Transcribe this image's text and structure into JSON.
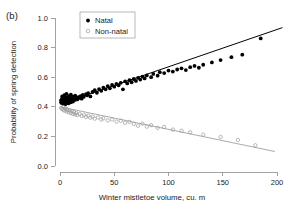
{
  "panel": {
    "label": "(b)"
  },
  "chart_data": {
    "type": "scatter",
    "title": "",
    "xlabel": "Winter mistletoe volume, cu. m",
    "ylabel": "Probability of spring detection",
    "xlim": [
      -8,
      210
    ],
    "ylim": [
      0.0,
      1.0
    ],
    "xticks": [
      0,
      50,
      100,
      150,
      200
    ],
    "xtick_labels": [
      "0",
      "50",
      "100",
      "150",
      "200"
    ],
    "yticks": [
      0.0,
      0.2,
      0.4,
      0.6,
      0.8,
      1.0
    ],
    "ytick_labels": [
      "0.0",
      "0.2",
      "0.4",
      "0.6",
      "0.8",
      "1.0"
    ],
    "grid": false,
    "legend_position": "top-left-inside",
    "series": [
      {
        "name": "Natal",
        "marker": "filled-circle",
        "color": "#000000",
        "points": [
          [
            1,
            0.43
          ],
          [
            1,
            0.445
          ],
          [
            2,
            0.425
          ],
          [
            2,
            0.455
          ],
          [
            2,
            0.47
          ],
          [
            3,
            0.42
          ],
          [
            3,
            0.44
          ],
          [
            3,
            0.462
          ],
          [
            4,
            0.432
          ],
          [
            4,
            0.45
          ],
          [
            4,
            0.478
          ],
          [
            5,
            0.418
          ],
          [
            5,
            0.442
          ],
          [
            5,
            0.465
          ],
          [
            6,
            0.428
          ],
          [
            6,
            0.452
          ],
          [
            6,
            0.488
          ],
          [
            7,
            0.436
          ],
          [
            7,
            0.458
          ],
          [
            8,
            0.424
          ],
          [
            8,
            0.447
          ],
          [
            8,
            0.472
          ],
          [
            9,
            0.44
          ],
          [
            9,
            0.463
          ],
          [
            10,
            0.43
          ],
          [
            10,
            0.455
          ],
          [
            10,
            0.482
          ],
          [
            11,
            0.444
          ],
          [
            12,
            0.435
          ],
          [
            12,
            0.468
          ],
          [
            13,
            0.452
          ],
          [
            14,
            0.447
          ],
          [
            14,
            0.476
          ],
          [
            15,
            0.458
          ],
          [
            16,
            0.45
          ],
          [
            17,
            0.466
          ],
          [
            18,
            0.46
          ],
          [
            19,
            0.472
          ],
          [
            20,
            0.455
          ],
          [
            21,
            0.48
          ],
          [
            22,
            0.468
          ],
          [
            24,
            0.486
          ],
          [
            25,
            0.478
          ],
          [
            26,
            0.492
          ],
          [
            28,
            0.47
          ],
          [
            30,
            0.5
          ],
          [
            32,
            0.512
          ],
          [
            34,
            0.495
          ],
          [
            36,
            0.52
          ],
          [
            38,
            0.508
          ],
          [
            40,
            0.53
          ],
          [
            42,
            0.518
          ],
          [
            44,
            0.54
          ],
          [
            46,
            0.525
          ],
          [
            48,
            0.548
          ],
          [
            50,
            0.536
          ],
          [
            52,
            0.555
          ],
          [
            54,
            0.545
          ],
          [
            56,
            0.562
          ],
          [
            58,
            0.518
          ],
          [
            60,
            0.572
          ],
          [
            62,
            0.558
          ],
          [
            64,
            0.58
          ],
          [
            66,
            0.566
          ],
          [
            68,
            0.588
          ],
          [
            70,
            0.575
          ],
          [
            72,
            0.596
          ],
          [
            74,
            0.584
          ],
          [
            76,
            0.604
          ],
          [
            78,
            0.592
          ],
          [
            80,
            0.612
          ],
          [
            84,
            0.6
          ],
          [
            86,
            0.622
          ],
          [
            90,
            0.61
          ],
          [
            92,
            0.634
          ],
          [
            96,
            0.628
          ],
          [
            100,
            0.645
          ],
          [
            104,
            0.638
          ],
          [
            108,
            0.652
          ],
          [
            112,
            0.66
          ],
          [
            116,
            0.648
          ],
          [
            120,
            0.668
          ],
          [
            124,
            0.676
          ],
          [
            128,
            0.664
          ],
          [
            132,
            0.684
          ],
          [
            140,
            0.7
          ],
          [
            148,
            0.716
          ],
          [
            158,
            0.735
          ],
          [
            168,
            0.752
          ],
          [
            185,
            0.862
          ]
        ]
      },
      {
        "name": "Non-natal",
        "marker": "open-circle",
        "color": "#9b9b9b",
        "points": [
          [
            1,
            0.392
          ],
          [
            2,
            0.386
          ],
          [
            3,
            0.38
          ],
          [
            3,
            0.398
          ],
          [
            4,
            0.374
          ],
          [
            5,
            0.39
          ],
          [
            6,
            0.368
          ],
          [
            6,
            0.384
          ],
          [
            7,
            0.378
          ],
          [
            8,
            0.362
          ],
          [
            9,
            0.374
          ],
          [
            10,
            0.358
          ],
          [
            11,
            0.37
          ],
          [
            12,
            0.352
          ],
          [
            13,
            0.364
          ],
          [
            14,
            0.348
          ],
          [
            15,
            0.358
          ],
          [
            16,
            0.344
          ],
          [
            18,
            0.352
          ],
          [
            20,
            0.338
          ],
          [
            22,
            0.346
          ],
          [
            24,
            0.332
          ],
          [
            26,
            0.34
          ],
          [
            28,
            0.326
          ],
          [
            30,
            0.334
          ],
          [
            32,
            0.32
          ],
          [
            35,
            0.328
          ],
          [
            38,
            0.314
          ],
          [
            40,
            0.322
          ],
          [
            44,
            0.308
          ],
          [
            48,
            0.314
          ],
          [
            52,
            0.3
          ],
          [
            56,
            0.306
          ],
          [
            60,
            0.292
          ],
          [
            64,
            0.298
          ],
          [
            68,
            0.284
          ],
          [
            72,
            0.272
          ],
          [
            76,
            0.286
          ],
          [
            80,
            0.266
          ],
          [
            84,
            0.276
          ],
          [
            90,
            0.258
          ],
          [
            96,
            0.264
          ],
          [
            104,
            0.246
          ],
          [
            112,
            0.238
          ],
          [
            120,
            0.228
          ],
          [
            132,
            0.212
          ],
          [
            148,
            0.196
          ],
          [
            164,
            0.176
          ],
          [
            180,
            0.14
          ]
        ]
      }
    ],
    "fit_lines": [
      {
        "name": "Natal fit",
        "color": "#000000",
        "x": [
          0,
          205
        ],
        "y": [
          0.418,
          0.935
        ]
      },
      {
        "name": "Non-natal fit",
        "color": "#9b9b9b",
        "x": [
          0,
          198
        ],
        "y": [
          0.4,
          0.098
        ]
      }
    ],
    "legend": [
      {
        "label": "Natal",
        "marker": "filled-circle",
        "color": "#000000"
      },
      {
        "label": "Non-natal",
        "marker": "open-circle",
        "color": "#9b9b9b"
      }
    ]
  }
}
